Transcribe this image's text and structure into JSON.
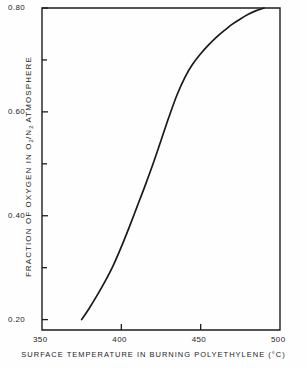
{
  "chart_data": {
    "type": "line",
    "title": "",
    "xlabel": "SURFACE TEMPERATURE IN BURNING POLYETHYLENE (°C)",
    "ylabel": "FRACTION OF OXYGEN IN O2/N2 ATMOSPHERE",
    "ylabel_parts": {
      "prefix": "FRACTION OF OXYGEN IN  O",
      "sub1": "2",
      "mid": "/N",
      "sub2": "2",
      "suffix": "  ATMOSPHERE"
    },
    "xlim": [
      350,
      500
    ],
    "ylim": [
      0.18,
      0.8
    ],
    "grid": false,
    "legend": "none",
    "xticks": [
      350,
      400,
      450,
      500
    ],
    "xtick_labels": [
      "350",
      "400",
      "450",
      "500"
    ],
    "x_minor_ticks": [
      375,
      425,
      475
    ],
    "yticks": [
      0.2,
      0.4,
      0.6,
      0.8
    ],
    "ytick_labels": [
      "0.20",
      "0.40",
      "0.60",
      "0.80"
    ],
    "y_minor_ticks": [
      0.3,
      0.5,
      0.7
    ],
    "series": [
      {
        "name": "oxygen fraction vs surface temperature",
        "color": "#1a1a1a",
        "x": [
          375,
          380,
          385,
          390,
          395,
          400,
          405,
          410,
          415,
          420,
          425,
          430,
          435,
          440,
          445,
          450,
          455,
          460,
          465,
          470,
          475,
          480,
          485,
          490
        ],
        "y": [
          0.2,
          0.223,
          0.248,
          0.275,
          0.305,
          0.34,
          0.378,
          0.418,
          0.458,
          0.5,
          0.545,
          0.59,
          0.632,
          0.666,
          0.692,
          0.712,
          0.729,
          0.744,
          0.757,
          0.769,
          0.779,
          0.788,
          0.795,
          0.8
        ]
      }
    ]
  },
  "axes_geometry": {
    "left_px": 42,
    "right_px": 280,
    "top_px": 8,
    "bottom_px": 330,
    "y_top_value": 0.8,
    "y_bottom_value": 0.18
  }
}
